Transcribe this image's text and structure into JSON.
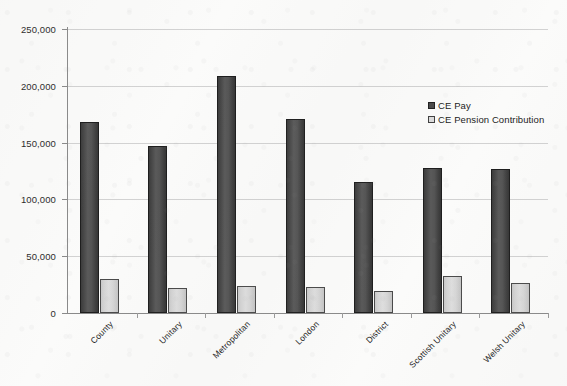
{
  "chart_data": {
    "type": "bar",
    "title": "",
    "subtitle": "",
    "xlabel": "",
    "ylabel": "",
    "ylim": [
      0,
      250000
    ],
    "y_ticks": [
      0,
      50000,
      100000,
      150000,
      200000,
      250000
    ],
    "y_tick_labels": [
      "0",
      "50,000",
      "100,000",
      "150,000",
      "200,000",
      "250,000"
    ],
    "grid": true,
    "legend_position": "top-right",
    "categories": [
      "County",
      "Unitary",
      "Metropolitan",
      "London",
      "District",
      "Scottish Unitary",
      "Welsh Unitary"
    ],
    "series": [
      {
        "name": "CE Pay",
        "color": "#4a4a4a",
        "values": [
          168000,
          147000,
          208500,
          171000,
          115000,
          128000,
          127000
        ]
      },
      {
        "name": "CE Pension Contribution",
        "color": "#dcdcdc",
        "values": [
          30000,
          22000,
          23500,
          22500,
          19000,
          33000,
          26000
        ]
      }
    ]
  },
  "legend": {
    "items": [
      {
        "label": "CE Pay",
        "swatch": "dark-gray-square-icon"
      },
      {
        "label": "CE Pension Contribution",
        "swatch": "light-gray-square-icon"
      }
    ]
  }
}
